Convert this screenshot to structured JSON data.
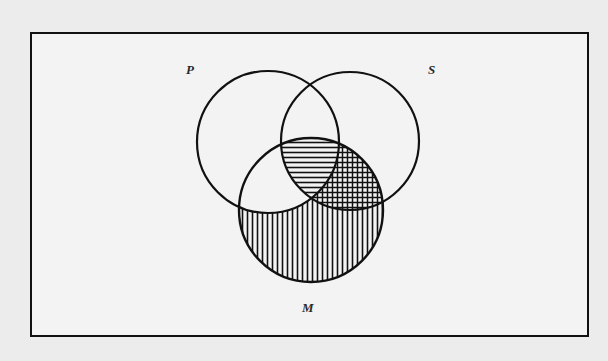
{
  "diagram": {
    "type": "venn-syllogism",
    "frame": {
      "x": 31,
      "y": 33,
      "width": 557,
      "height": 303
    },
    "circles": [
      {
        "id": "P",
        "label": "P",
        "cx": 268,
        "cy": 142,
        "r": 71,
        "label_x": 186,
        "label_y": 74
      },
      {
        "id": "S",
        "label": "S",
        "cx": 350,
        "cy": 141,
        "r": 69,
        "label_x": 428,
        "label_y": 74
      },
      {
        "id": "M",
        "label": "M",
        "cx": 311,
        "cy": 210,
        "r": 72,
        "label_x": 303,
        "label_y": 312
      }
    ],
    "regions": [
      {
        "name": "P∩S∩M",
        "shading": "horizontal-lines"
      },
      {
        "name": "S∩M not P",
        "shading": "cross-hatch"
      },
      {
        "name": "M only",
        "shading": "vertical-lines"
      },
      {
        "name": "P∩M not S",
        "shading": "none"
      }
    ],
    "colors": {
      "ink": "#111111",
      "background": "#ececec",
      "frame_fill": "#f3f3f3"
    }
  },
  "labels": {
    "p": "P",
    "s": "S",
    "m": "M"
  }
}
